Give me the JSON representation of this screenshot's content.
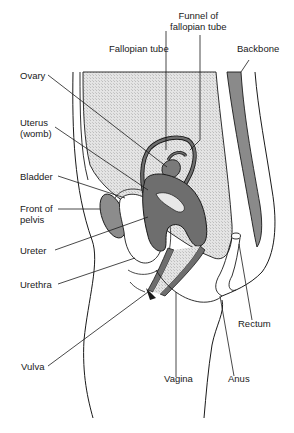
{
  "diagram": {
    "colors": {
      "line": "#1a1a1a",
      "stipple": "#dcdcdc",
      "organ_dark": "#6e6e6e",
      "organ_mid": "#8c8c8c",
      "background": "#ffffff"
    },
    "labels": {
      "funnel": "Funnel of\nfallopian tube",
      "fallopian_tube": "Fallopian tube",
      "backbone": "Backbone",
      "ovary": "Ovary",
      "uterus": "Uterus\n(womb)",
      "bladder": "Bladder",
      "front_of_pelvis": "Front of\npelvis",
      "ureter": "Ureter",
      "urethra": "Urethra",
      "rectum": "Rectum",
      "vulva": "Vulva",
      "vagina": "Vagina",
      "anus": "Anus"
    }
  }
}
